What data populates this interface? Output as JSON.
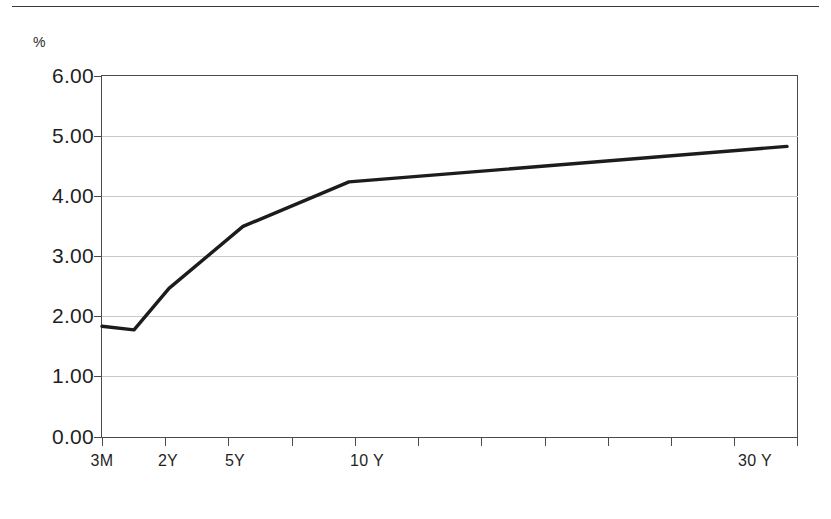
{
  "figure": {
    "unit_label": "%",
    "line_color": "#1c1c1c",
    "grid_color": "#c9c9c9",
    "axis_color": "#4a4a4a",
    "background": "#ffffff"
  },
  "chart_data": {
    "type": "line",
    "title": "",
    "subtitle": "",
    "xlabel": "",
    "ylabel": "%",
    "ylim": [
      0.0,
      6.0
    ],
    "ytick_labels": [
      "6.00",
      "5.00",
      "4.00",
      "3.00",
      "2.00",
      "1.00",
      "0.00"
    ],
    "ytick_values": [
      6.0,
      5.0,
      4.0,
      3.0,
      2.0,
      1.0,
      0.0
    ],
    "grid": true,
    "grid_axis": "y",
    "legend": "none",
    "xtick_labels": [
      "3M",
      "2Y",
      "5Y",
      "10 Y",
      "30 Y"
    ],
    "xtick_label_positions": [
      0,
      1,
      2,
      4,
      10
    ],
    "x_tick_count": 12,
    "categories": [
      "3M",
      "6M",
      "2Y",
      "5Y",
      "10 Y",
      "30 Y"
    ],
    "x": [
      0,
      0.47,
      1.0,
      2.13,
      3.74,
      10.35
    ],
    "values": [
      1.84,
      1.78,
      2.47,
      3.5,
      4.24,
      4.83
    ],
    "series": [
      {
        "name": "Yield curve",
        "values": [
          1.84,
          1.78,
          2.47,
          3.5,
          4.24,
          4.83
        ]
      }
    ],
    "points_px": [
      {
        "x": 102,
        "y": 326
      },
      {
        "x": 134,
        "y": 330
      },
      {
        "x": 169,
        "y": 288
      },
      {
        "x": 243,
        "y": 226
      },
      {
        "x": 349,
        "y": 182
      },
      {
        "x": 787,
        "y": 146
      }
    ]
  },
  "axes": {
    "plot_left_px": 101,
    "plot_right_px": 798,
    "plot_top_px": 75,
    "plot_bottom_px": 438,
    "ygrid_px": [
      76,
      136,
      196,
      256,
      316,
      376,
      437
    ],
    "xtick_px": [
      102,
      165,
      228,
      292,
      355,
      418,
      481,
      545,
      608,
      671,
      734,
      797
    ],
    "xlabel_px": [
      102,
      168,
      235,
      367,
      755
    ]
  }
}
